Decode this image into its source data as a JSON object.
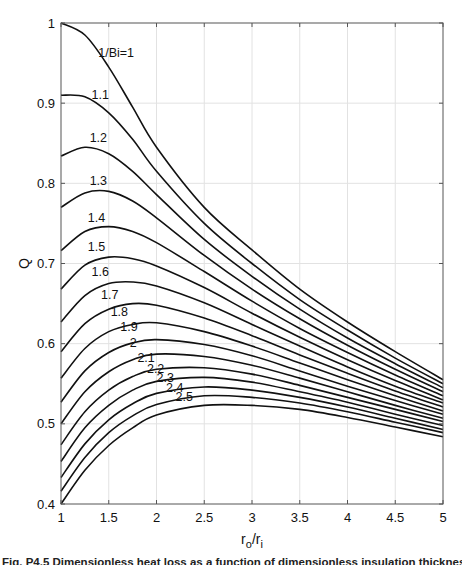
{
  "chart_data": {
    "type": "line",
    "title": "",
    "xlabel": "r_o/r_i",
    "ylabel": "Q",
    "xlim": [
      1,
      5
    ],
    "ylim": [
      0.4,
      1.0
    ],
    "xticks": [
      1,
      1.5,
      2,
      2.5,
      3,
      3.5,
      4,
      4.5,
      5
    ],
    "xtick_labels": [
      "1",
      "1.5",
      "2",
      "2.5",
      "3",
      "3.5",
      "4",
      "4.5",
      "5"
    ],
    "yticks": [
      0.4,
      0.5,
      0.6,
      0.7,
      0.8,
      0.9,
      1.0
    ],
    "ytick_labels": [
      "0.4",
      "0.5",
      "0.6",
      "0.7",
      "0.8",
      "0.9",
      "1"
    ],
    "grid": true,
    "legend": "inline curve labels",
    "x": [
      1,
      1.25,
      1.5,
      1.75,
      2,
      2.5,
      3,
      3.5,
      4,
      4.5,
      5
    ],
    "series": [
      {
        "name": "1/Bi=1",
        "label": "1/Bi=1",
        "label_pos": [
          1.39,
          0.958
        ],
        "values": [
          1.0,
          0.985,
          0.945,
          0.895,
          0.845,
          0.77,
          0.717,
          0.668,
          0.627,
          0.59,
          0.555
        ]
      },
      {
        "name": "1.1",
        "label": "1.1",
        "label_pos": [
          1.32,
          0.905
        ],
        "values": [
          0.91,
          0.908,
          0.888,
          0.855,
          0.815,
          0.75,
          0.7,
          0.655,
          0.617,
          0.582,
          0.55
        ]
      },
      {
        "name": "1.2",
        "label": "1.2",
        "label_pos": [
          1.3,
          0.852
        ],
        "values": [
          0.834,
          0.845,
          0.837,
          0.815,
          0.786,
          0.73,
          0.684,
          0.643,
          0.607,
          0.575,
          0.545
        ]
      },
      {
        "name": "1.3",
        "label": "1.3",
        "label_pos": [
          1.3,
          0.798
        ],
        "values": [
          0.77,
          0.788,
          0.79,
          0.778,
          0.757,
          0.71,
          0.668,
          0.631,
          0.598,
          0.568,
          0.54
        ]
      },
      {
        "name": "1.4",
        "label": "1.4",
        "label_pos": [
          1.28,
          0.752
        ],
        "values": [
          0.716,
          0.74,
          0.746,
          0.74,
          0.726,
          0.69,
          0.653,
          0.619,
          0.589,
          0.561,
          0.535
        ]
      },
      {
        "name": "1.5",
        "label": "1.5",
        "label_pos": [
          1.28,
          0.716
        ],
        "values": [
          0.668,
          0.698,
          0.708,
          0.706,
          0.697,
          0.67,
          0.638,
          0.608,
          0.58,
          0.554,
          0.53
        ]
      },
      {
        "name": "1.6",
        "label": "1.6",
        "label_pos": [
          1.32,
          0.685
        ],
        "values": [
          0.627,
          0.66,
          0.675,
          0.677,
          0.672,
          0.651,
          0.624,
          0.597,
          0.571,
          0.547,
          0.526
        ]
      },
      {
        "name": "1.7",
        "label": "1.7",
        "label_pos": [
          1.42,
          0.656
        ],
        "values": [
          0.59,
          0.625,
          0.643,
          0.65,
          0.648,
          0.632,
          0.61,
          0.586,
          0.563,
          0.541,
          0.521
        ]
      },
      {
        "name": "1.8",
        "label": "1.8",
        "label_pos": [
          1.52,
          0.635
        ],
        "values": [
          0.557,
          0.594,
          0.615,
          0.624,
          0.626,
          0.615,
          0.597,
          0.576,
          0.555,
          0.535,
          0.516
        ]
      },
      {
        "name": "1.9",
        "label": "1.9",
        "label_pos": [
          1.62,
          0.616
        ],
        "values": [
          0.527,
          0.566,
          0.589,
          0.601,
          0.605,
          0.599,
          0.585,
          0.566,
          0.547,
          0.529,
          0.512
        ]
      },
      {
        "name": "2",
        "label": "2",
        "label_pos": [
          1.72,
          0.596
        ],
        "values": [
          0.5,
          0.54,
          0.565,
          0.58,
          0.587,
          0.584,
          0.573,
          0.557,
          0.54,
          0.523,
          0.507
        ]
      },
      {
        "name": "2.1",
        "label": "2.1",
        "label_pos": [
          1.8,
          0.577
        ],
        "values": [
          0.474,
          0.515,
          0.542,
          0.559,
          0.568,
          0.57,
          0.562,
          0.548,
          0.533,
          0.518,
          0.503
        ]
      },
      {
        "name": "2.2",
        "label": "2.2",
        "label_pos": [
          1.9,
          0.564
        ],
        "values": [
          0.453,
          0.495,
          0.523,
          0.542,
          0.553,
          0.558,
          0.552,
          0.54,
          0.527,
          0.512,
          0.498
        ]
      },
      {
        "name": "2.3",
        "label": "2.3",
        "label_pos": [
          2.0,
          0.552
        ],
        "values": [
          0.433,
          0.475,
          0.505,
          0.525,
          0.538,
          0.546,
          0.542,
          0.533,
          0.521,
          0.507,
          0.493
        ]
      },
      {
        "name": "2.4",
        "label": "2.4",
        "label_pos": [
          2.1,
          0.54
        ],
        "values": [
          0.416,
          0.458,
          0.489,
          0.51,
          0.524,
          0.535,
          0.533,
          0.526,
          0.515,
          0.502,
          0.489
        ]
      },
      {
        "name": "2.5",
        "label": "2.5",
        "label_pos": [
          2.2,
          0.528
        ],
        "values": [
          0.4,
          0.442,
          0.473,
          0.495,
          0.511,
          0.523,
          0.523,
          0.518,
          0.508,
          0.496,
          0.484
        ]
      }
    ]
  },
  "caption": "Fig. P4.5 Dimensionless heat loss as a function of dimensionless insulation thickness and Bi"
}
